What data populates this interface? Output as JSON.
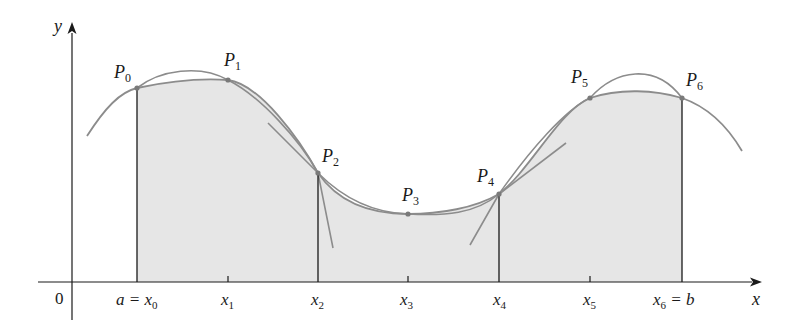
{
  "figure": {
    "colors": {
      "shade": "#e6e6e6",
      "curve": "#8c8c8c",
      "axis": "#1a1a1a",
      "point": "#7a7a7a"
    },
    "axes": {
      "x_label": "x",
      "y_label": "y",
      "origin_label": "0"
    },
    "ticks": [
      {
        "id": "x0",
        "main": "a = x",
        "sub": "0",
        "x": 137
      },
      {
        "id": "x1",
        "main": "x",
        "sub": "1",
        "x": 228
      },
      {
        "id": "x2",
        "main": "x",
        "sub": "2",
        "x": 318
      },
      {
        "id": "x3",
        "main": "x",
        "sub": "3",
        "x": 408
      },
      {
        "id": "x4",
        "main": "x",
        "sub": "4",
        "x": 499
      },
      {
        "id": "x5",
        "main": "x",
        "sub": "5",
        "x": 590
      },
      {
        "id": "x6",
        "main": "x",
        "sub": "6",
        "suffix": " = b",
        "x": 682
      }
    ],
    "points": [
      {
        "main": "P",
        "sub": "0",
        "x": 137,
        "y": 88
      },
      {
        "main": "P",
        "sub": "1",
        "x": 228,
        "y": 80
      },
      {
        "main": "P",
        "sub": "2",
        "x": 318,
        "y": 173
      },
      {
        "main": "P",
        "sub": "3",
        "x": 408,
        "y": 214
      },
      {
        "main": "P",
        "sub": "4",
        "x": 499,
        "y": 194
      },
      {
        "main": "P",
        "sub": "5",
        "x": 590,
        "y": 98
      },
      {
        "main": "P",
        "sub": "6",
        "x": 682,
        "y": 98
      }
    ]
  }
}
